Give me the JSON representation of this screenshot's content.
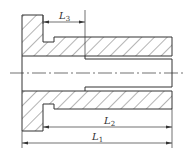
{
  "figure": {
    "type": "technical-section-drawing",
    "colors": {
      "line": "#333333",
      "background": "#ffffff"
    }
  },
  "dimensions": [
    {
      "id": "L3",
      "symbol": "L",
      "subscript": "3"
    },
    {
      "id": "L2",
      "symbol": "L",
      "subscript": "2"
    },
    {
      "id": "L1",
      "symbol": "L",
      "subscript": "1"
    }
  ]
}
